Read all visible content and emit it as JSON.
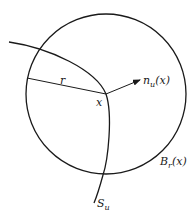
{
  "diagram": {
    "circle": {
      "cx": 106,
      "cy": 94,
      "r": 80,
      "label": "B",
      "label_sub": "r",
      "label_arg": "(x)"
    },
    "point": {
      "label": "x",
      "x": 106,
      "y": 94
    },
    "radius": {
      "label": "r"
    },
    "normal": {
      "label": "n",
      "label_sub": "u",
      "label_arg": "(x)"
    },
    "surface": {
      "label": "S",
      "label_sub": "u"
    },
    "colors": {
      "stroke": "#1a1a1a",
      "background": "#ffffff"
    }
  }
}
